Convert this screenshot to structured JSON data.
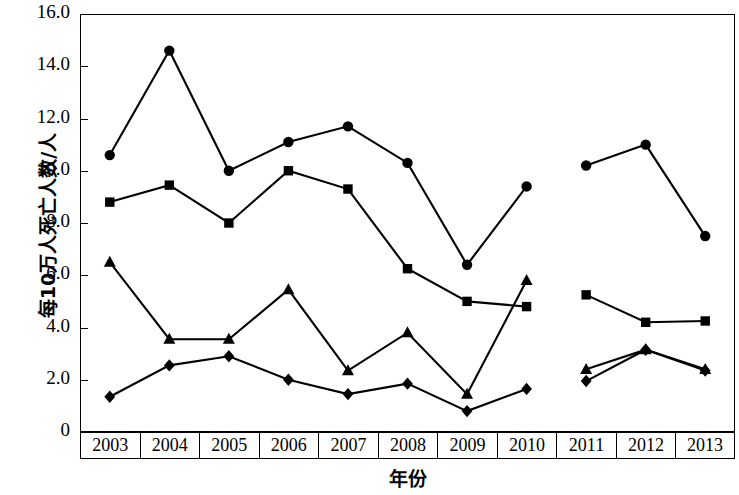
{
  "chart_data": {
    "type": "line",
    "title": "",
    "xlabel": "年份",
    "ylabel": "每10万人死亡人数/人",
    "categories": [
      "2003",
      "2004",
      "2005",
      "2006",
      "2007",
      "2008",
      "2009",
      "2010",
      "2011",
      "2012",
      "2013"
    ],
    "ylim": [
      0,
      16.0
    ],
    "ytick_labels": [
      "16.0",
      "14.0",
      "12.0",
      "10.0",
      "8.0",
      "6.0",
      "4.0",
      "2.0",
      "0"
    ],
    "ytick_values": [
      16.0,
      14.0,
      12.0,
      10.0,
      8.0,
      6.0,
      4.0,
      2.0,
      0
    ],
    "grid": false,
    "legend": "none",
    "series_break_after": "2010",
    "series": [
      {
        "name": "circle-series",
        "marker": "circle",
        "color": "#000000",
        "values": [
          10.6,
          14.6,
          10.0,
          11.1,
          11.7,
          10.3,
          6.4,
          9.4,
          10.2,
          11.0,
          7.5
        ]
      },
      {
        "name": "square-series",
        "marker": "square",
        "color": "#000000",
        "values": [
          8.8,
          9.45,
          8.0,
          10.0,
          9.3,
          6.25,
          5.0,
          4.8,
          5.25,
          4.2,
          4.25
        ]
      },
      {
        "name": "triangle-series",
        "marker": "triangle",
        "color": "#000000",
        "values": [
          6.5,
          3.55,
          3.55,
          5.45,
          2.35,
          3.8,
          1.45,
          5.8,
          2.4,
          3.15,
          2.4
        ]
      },
      {
        "name": "diamond-series",
        "marker": "diamond",
        "color": "#000000",
        "values": [
          1.35,
          2.55,
          2.9,
          2.0,
          1.45,
          1.85,
          0.8,
          1.65,
          1.95,
          3.15,
          2.35
        ]
      }
    ]
  },
  "axes": {
    "y_label": "每10万人死亡人数/人",
    "x_label": "年份",
    "y_ticks": [
      "16.0",
      "14.0",
      "12.0",
      "10.0",
      "8.0",
      "6.0",
      "4.0",
      "2.0",
      "0"
    ],
    "x_ticks": [
      "2003",
      "2004",
      "2005",
      "2006",
      "2007",
      "2008",
      "2009",
      "2010",
      "2011",
      "2012",
      "2013"
    ]
  }
}
